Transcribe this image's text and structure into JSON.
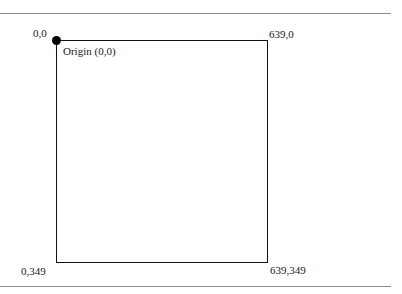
{
  "diagram": {
    "labels": {
      "top_left": "0,0",
      "origin": "Origin (0,0)",
      "top_right": "639,0",
      "bottom_left": "0,349",
      "bottom_right": "639,349"
    },
    "colors": {
      "frame": "#111111",
      "rule": "#8a8a8a",
      "dot": "#000000"
    }
  }
}
